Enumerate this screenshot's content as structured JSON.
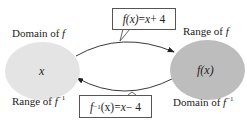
{
  "diagram": {
    "left_set": {
      "label_top": "Domain of",
      "label_top_var": "f",
      "label_bottom": "Range of",
      "label_bottom_var": "f",
      "label_bottom_sup": "−1",
      "element": "x",
      "fill": "#e4e4e4"
    },
    "right_set": {
      "label_top": "Range of",
      "label_top_var": "f",
      "label_bottom": "Domain of",
      "label_bottom_var": "f",
      "label_bottom_sup": "−1",
      "element": "f(x)",
      "fill": "#bdbdbd"
    },
    "forward_map": {
      "lhs": "f(x)",
      "eq": " = ",
      "rhs_var": "x",
      "rhs_rest": " + 4"
    },
    "inverse_map": {
      "lhs_f": "f",
      "lhs_sup": "−1",
      "lhs_arg": "(x)",
      "eq": " = ",
      "rhs_var": "x",
      "rhs_rest": " − 4"
    }
  }
}
